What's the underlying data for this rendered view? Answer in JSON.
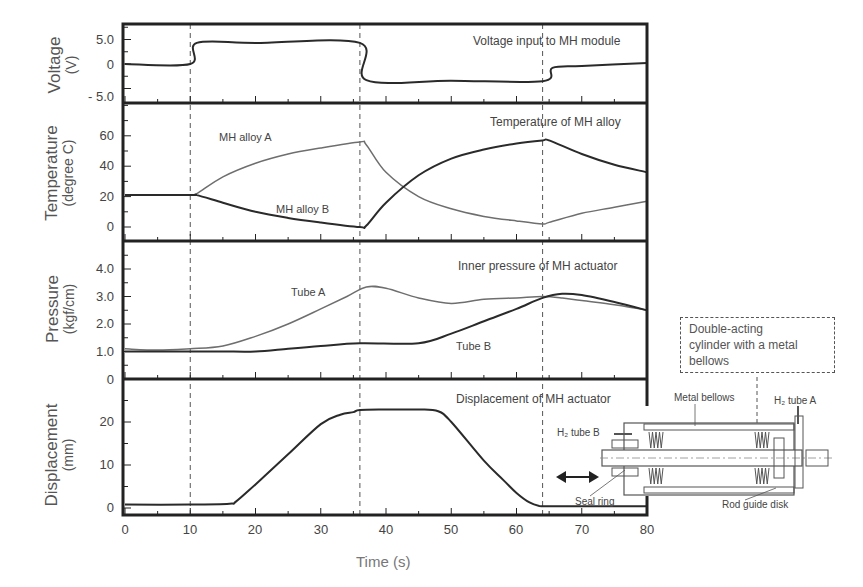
{
  "chart_data": {
    "type": "line",
    "title": "",
    "xlabel": "Time (s)",
    "xlim": [
      0,
      80
    ],
    "xticks": [
      0,
      10,
      20,
      30,
      40,
      50,
      60,
      70,
      80
    ],
    "vertical_reference_lines": [
      10,
      36,
      64
    ],
    "panels": [
      {
        "id": "voltage",
        "title": "Voltage input to MH module",
        "ylabel": "Voltage",
        "yunit": "(V)",
        "ylim": [
          -6.5,
          8.0
        ],
        "yticks": [
          5.0,
          0,
          -5.0
        ],
        "ytick_labels": [
          "5.0",
          "0",
          "- 5.0"
        ],
        "series": [
          {
            "name": "Voltage",
            "x": [
              0,
              10,
              11,
              20,
              36,
              37,
              50,
              64,
              65.5,
              70,
              80
            ],
            "y": [
              0,
              0,
              4.3,
              4.3,
              4.3,
              -3.3,
              -3.4,
              -3.5,
              -0.8,
              -0.4,
              0.2
            ]
          }
        ]
      },
      {
        "id": "temperature",
        "title": "Temperature of MH alloy",
        "ylabel": "Temperature",
        "yunit": "(degree C)",
        "ylim": [
          -10,
          80
        ],
        "yticks": [
          0,
          20,
          40,
          60
        ],
        "ytick_labels": [
          "0",
          "20",
          "40",
          "60"
        ],
        "series": [
          {
            "name": "MH alloy A",
            "x": [
              0,
              10,
              11,
              15,
              20,
              25,
              30,
              36,
              37,
              40,
              45,
              50,
              55,
              60,
              64,
              65,
              70,
              75,
              80
            ],
            "y": [
              21,
              21,
              22,
              33,
              42,
              48,
              52,
              56,
              54,
              36,
              20,
              12,
              7,
              4,
              2,
              3,
              9,
              13,
              17
            ]
          },
          {
            "name": "MH alloy B",
            "x": [
              0,
              10,
              11,
              15,
              20,
              25,
              30,
              36,
              37,
              40,
              45,
              50,
              55,
              60,
              64,
              65,
              70,
              75,
              80
            ],
            "y": [
              21,
              21,
              21,
              16,
              10,
              6,
              3,
              0,
              1,
              16,
              34,
              45,
              51,
              55,
              57,
              57,
              48,
              41,
              36
            ]
          }
        ],
        "annotations": [
          "MH alloy A",
          "MH alloy B"
        ]
      },
      {
        "id": "pressure",
        "title": "Inner pressure of MH actuator",
        "ylabel": "Pressure",
        "yunit": "(kgf/cm)",
        "ylim": [
          0,
          5.0
        ],
        "yticks": [
          0,
          1.0,
          2.0,
          3.0,
          4.0
        ],
        "ytick_labels": [
          "0",
          "1.0",
          "2.0",
          "3.0",
          "4.0"
        ],
        "series": [
          {
            "name": "Tube A",
            "x": [
              0,
              5,
              10,
              15,
              20,
              25,
              30,
              34,
              37,
              40,
              45,
              50,
              55,
              60,
              64,
              67,
              70,
              75,
              80
            ],
            "y": [
              1.1,
              1.05,
              1.1,
              1.2,
              1.55,
              2.0,
              2.55,
              3.0,
              3.35,
              3.3,
              2.95,
              2.75,
              2.9,
              2.95,
              3.0,
              2.95,
              2.85,
              2.7,
              2.5
            ]
          },
          {
            "name": "Tube B",
            "x": [
              0,
              10,
              15,
              20,
              25,
              30,
              36,
              45,
              50,
              55,
              60,
              64,
              67,
              70,
              75,
              80
            ],
            "y": [
              1.0,
              1.0,
              1.0,
              1.0,
              1.1,
              1.2,
              1.3,
              1.3,
              1.65,
              2.1,
              2.55,
              2.95,
              3.1,
              3.05,
              2.8,
              2.5
            ]
          }
        ],
        "annotations": [
          "Tube A",
          "Tube B"
        ]
      },
      {
        "id": "displacement",
        "title": "Displacement of MH actuator",
        "ylabel": "Displacement",
        "yunit": "(mm)",
        "ylim": [
          -1,
          29
        ],
        "yticks": [
          0,
          10,
          20
        ],
        "ytick_labels": [
          "0",
          "10",
          "20"
        ],
        "series": [
          {
            "name": "Displacement",
            "x": [
              0,
              10,
              16,
              17,
              20,
              25,
              30,
              33,
              35,
              36,
              40,
              45,
              48,
              50,
              55,
              58,
              60,
              62,
              63.5,
              65,
              70,
              80
            ],
            "y": [
              0.8,
              0.8,
              1.0,
              1.5,
              5.5,
              12.5,
              19.5,
              21.7,
              22.3,
              22.8,
              22.9,
              22.9,
              22.5,
              20,
              11,
              6.5,
              3.5,
              1.3,
              0.5,
              0.4,
              0.4,
              0.4
            ]
          }
        ]
      }
    ]
  },
  "labels": {
    "voltage": {
      "ylabel": "Voltage",
      "unit": "(V)",
      "title": "Voltage input to MH module",
      "ticks": [
        "5.0",
        "0",
        "- 5.0"
      ]
    },
    "temperature": {
      "ylabel": "Temperature",
      "unit": "(degree C)",
      "title": "Temperature of MH alloy",
      "ticks": [
        "60",
        "40",
        "20",
        "0"
      ],
      "series_a": "MH alloy A",
      "series_b": "MH alloy B"
    },
    "pressure": {
      "ylabel": "Pressure",
      "unit": "(kgf/cm)",
      "title": "Inner pressure of MH actuator",
      "ticks": [
        "4.0",
        "3.0",
        "2.0",
        "1.0",
        "0"
      ],
      "series_a": "Tube A",
      "series_b": "Tube B"
    },
    "displacement": {
      "ylabel": "Displacement",
      "unit": "(mm)",
      "title": "Displacement of MH actuator",
      "ticks": [
        "20",
        "10",
        "0"
      ]
    },
    "xaxis": {
      "label": "Time (s)",
      "ticks": [
        "0",
        "10",
        "20",
        "30",
        "40",
        "50",
        "60",
        "70",
        "80"
      ]
    }
  },
  "inset": {
    "box_text": "Double-acting cylinder with a metal bellows",
    "box_lines": [
      "Double-acting",
      "cylinder with a metal",
      "bellows"
    ],
    "metal_bellows": "Metal bellows",
    "h2_tube_a": "H₂ tube A",
    "h2_tube_b": "H₂ tube B",
    "seal_ring": "Seal ring",
    "rod_guide_disk": "Rod guide disk"
  },
  "colors": {
    "frame": "#222222",
    "series_dark": "#2a2a2a",
    "series_light": "#6e6e6e",
    "text": "#444444",
    "axis_label": "#666666"
  }
}
